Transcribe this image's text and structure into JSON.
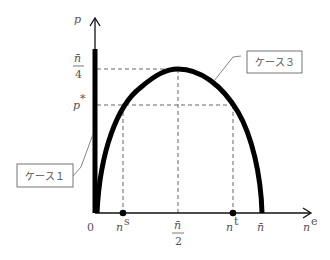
{
  "diagram": {
    "type": "economic-curve",
    "axes": {
      "y_label": "p",
      "x_label": "n",
      "x_label_superscript": "e",
      "origin_label": "0"
    },
    "y_ticks": [
      {
        "id": "nbar-over-4",
        "numerator": "n̄",
        "denominator": "4"
      },
      {
        "id": "p-star",
        "label": "p",
        "superscript": "*"
      }
    ],
    "x_ticks": [
      {
        "id": "n-s",
        "label": "n",
        "superscript": "s",
        "marked_point": true
      },
      {
        "id": "nbar-over-2",
        "numerator": "n̄",
        "denominator": "2"
      },
      {
        "id": "n-t",
        "label": "n",
        "superscript": "t",
        "marked_point": true
      },
      {
        "id": "nbar",
        "label": "n̄"
      }
    ],
    "callouts": {
      "case1": "ケース１",
      "case3": "ケース３"
    },
    "colors": {
      "curve": "#000000",
      "axis": "#111111",
      "dash": "#555555",
      "text": "#555555",
      "box_border": "#666666"
    }
  }
}
